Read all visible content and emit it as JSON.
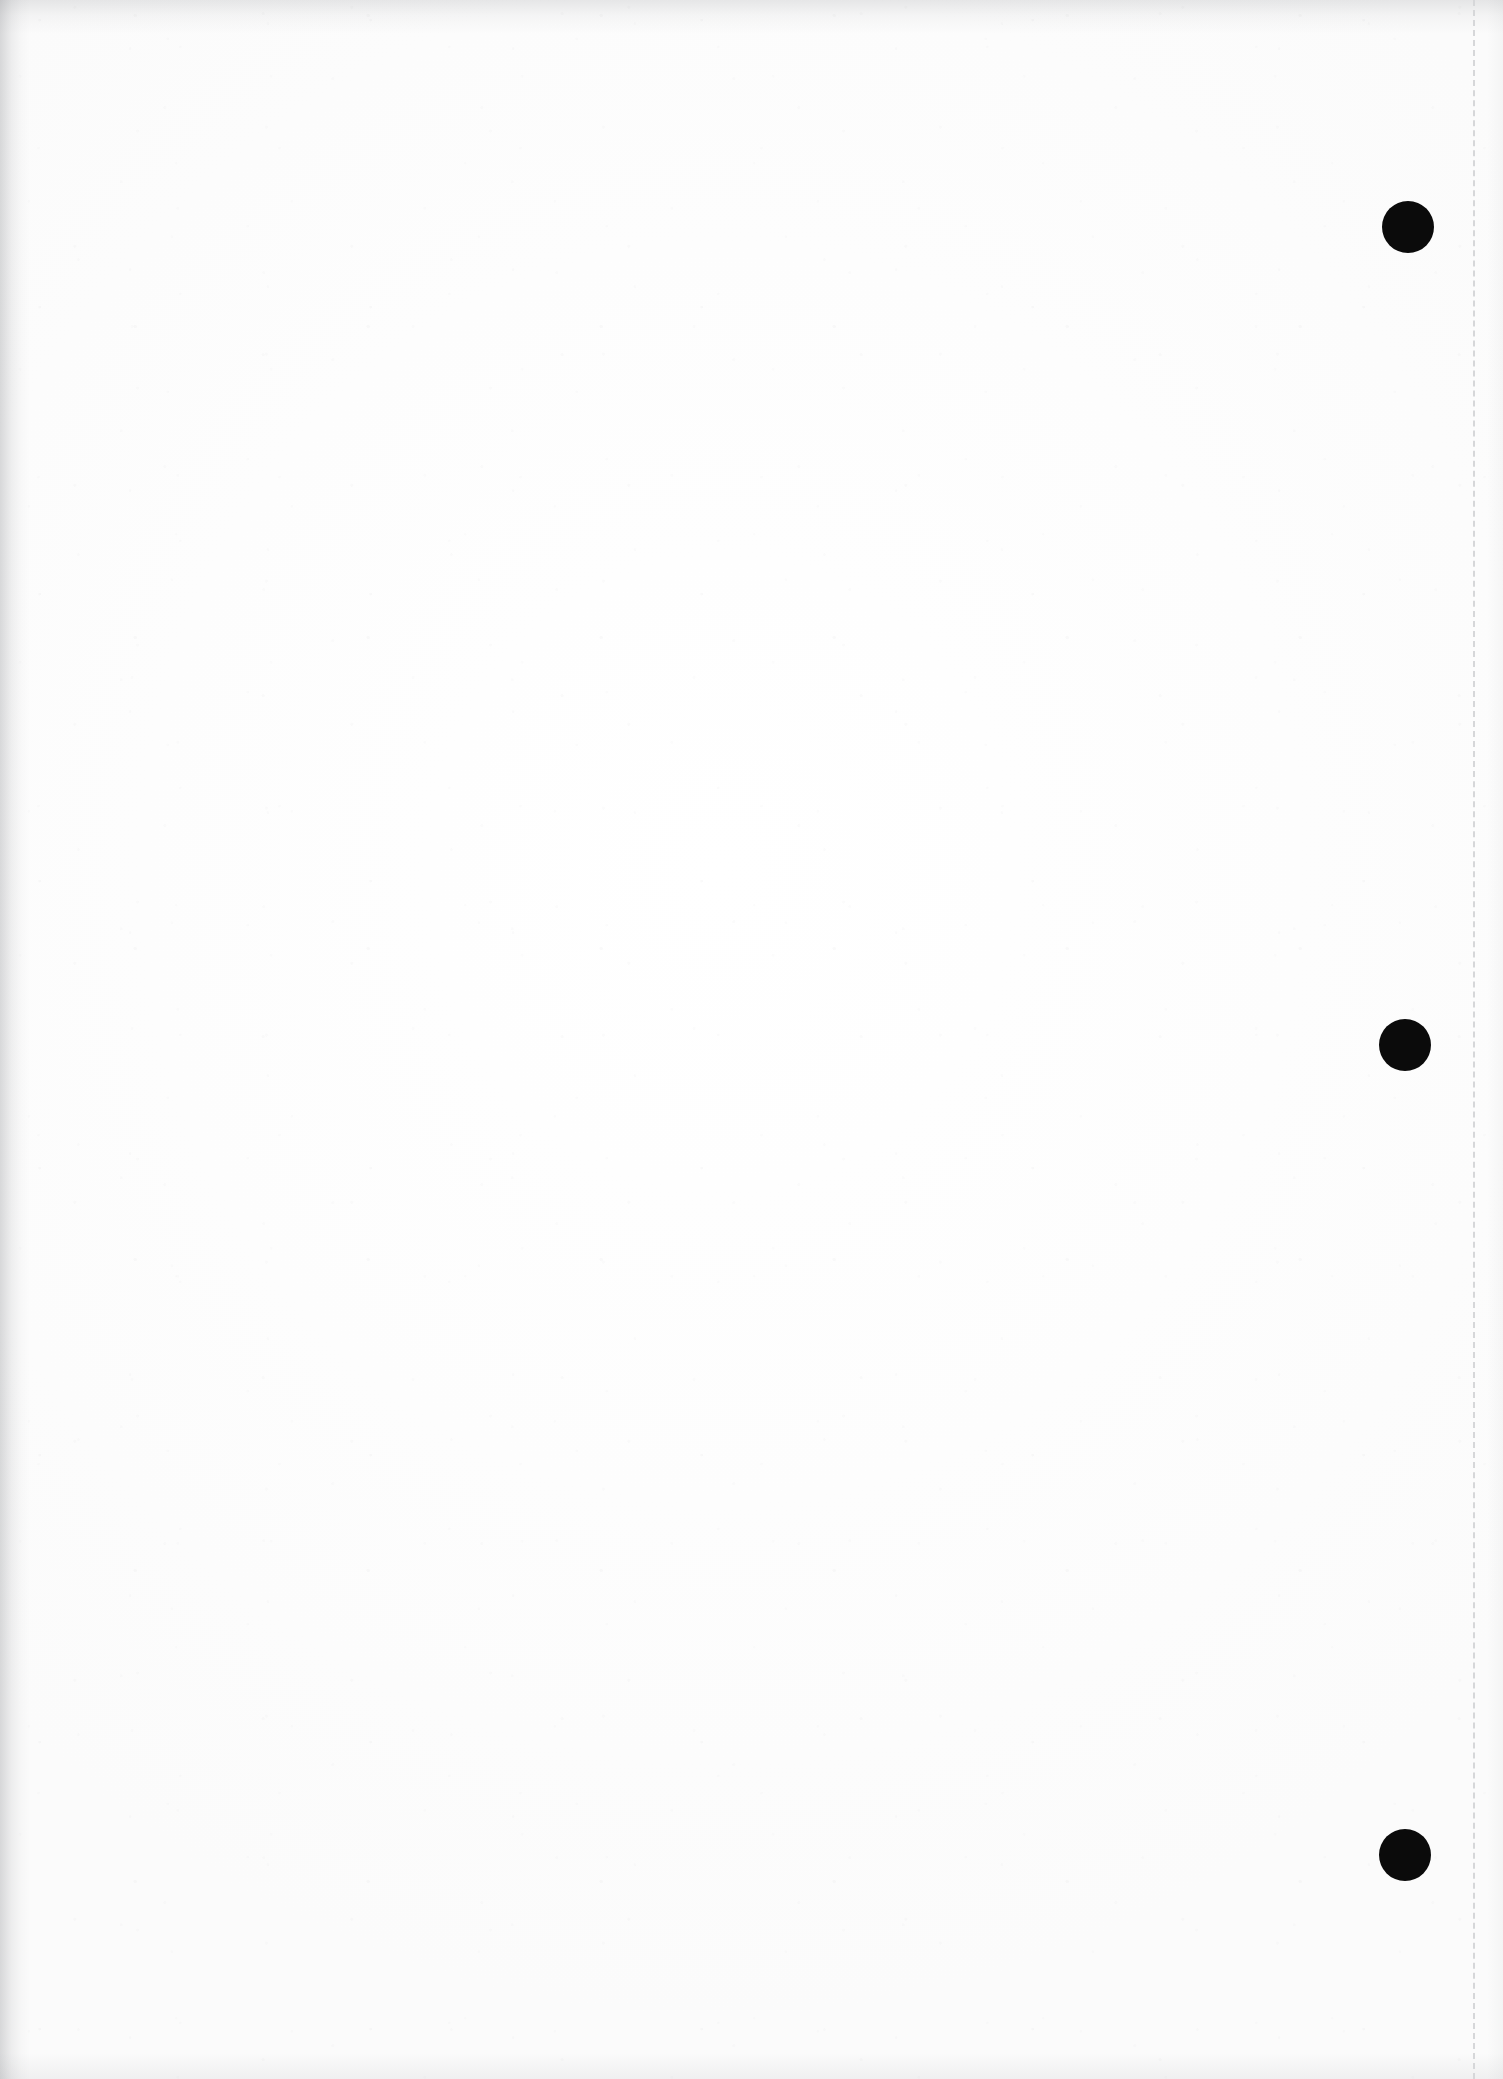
{
  "document": {
    "kind": "scanned-page",
    "page_label": "",
    "body_text": "",
    "width_px": 1503,
    "height_px": 2079,
    "paper_color": "#fefefe",
    "ink_color": "#0b0b0b",
    "rule_color": "#d6d7d9"
  },
  "margin_rule": {
    "name": "dashed-margin-rule",
    "x_px": 1473,
    "top_px": 0,
    "bottom_px": 2079,
    "style": "dashed",
    "thickness_px": 2,
    "color": "#d6d7d9"
  },
  "margin_dots": [
    {
      "label": "1",
      "cx_px": 1408,
      "cy_px": 227,
      "diameter_px": 52,
      "color": "#0b0b0b"
    },
    {
      "label": "2",
      "cx_px": 1405,
      "cy_px": 1045,
      "diameter_px": 52,
      "color": "#0b0b0b"
    },
    {
      "label": "3",
      "cx_px": 1405,
      "cy_px": 1855,
      "diameter_px": 52,
      "color": "#0b0b0b"
    }
  ],
  "edges": {
    "top_shadow": true,
    "left_shadow": true,
    "bottom_shadow": true,
    "right_shadow": true
  }
}
